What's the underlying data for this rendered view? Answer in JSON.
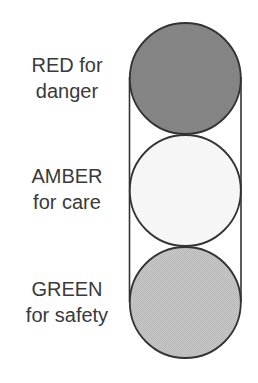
{
  "diagram": {
    "type": "traffic-light",
    "lights": [
      {
        "name": "red",
        "line1": "RED for",
        "line2": "danger",
        "fill": "#8a8a8a"
      },
      {
        "name": "amber",
        "line1": "AMBER",
        "line2": "for care",
        "fill": "#f6f6f6"
      },
      {
        "name": "green",
        "line1": "GREEN",
        "line2": "for safety",
        "fill": "#c8c8c8"
      }
    ],
    "outline_color": "#333333"
  }
}
